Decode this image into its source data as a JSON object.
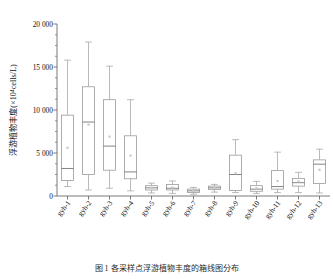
{
  "figure": {
    "caption": "图 1 各采样点浮游植物丰度的箱线图分布"
  },
  "chart_data": {
    "type": "box",
    "title": "",
    "xlabel": "",
    "ylabel": "浮游植物丰度(×10⁴cells/L)",
    "ylim": [
      0,
      20000
    ],
    "ytick_labels": [
      "0",
      "5 000",
      "10 000",
      "15 000",
      "20 000"
    ],
    "ytick_values": [
      0,
      5000,
      10000,
      15000,
      20000
    ],
    "yminor_step": 1250,
    "grid": false,
    "legend": null,
    "categories": [
      "gyh-1",
      "gyh-2",
      "gyh-3",
      "gyh-4",
      "gyh-5",
      "gyh-6",
      "gyh-7",
      "gyh-8",
      "gyh-9",
      "gyh-10",
      "gyh-11",
      "gyh-12",
      "gyh-13"
    ],
    "boxes": [
      {
        "label": "gyh-1",
        "min": 1100,
        "q1": 1800,
        "median": 3200,
        "q3": 9400,
        "max": 15800,
        "mean": 5600
      },
      {
        "label": "gyh-2",
        "min": 700,
        "q1": 2500,
        "median": 8600,
        "q3": 12700,
        "max": 17900,
        "mean": 8300
      },
      {
        "label": "gyh-3",
        "min": 900,
        "q1": 3000,
        "median": 5800,
        "q3": 11200,
        "max": 15100,
        "mean": 6900
      },
      {
        "label": "gyh-4",
        "min": 600,
        "q1": 2000,
        "median": 2800,
        "q3": 7000,
        "max": 11200,
        "mean": 4700
      },
      {
        "label": "gyh-5",
        "min": 350,
        "q1": 700,
        "median": 950,
        "q3": 1200,
        "max": 1500,
        "mean": 950
      },
      {
        "label": "gyh-6",
        "min": 300,
        "q1": 700,
        "median": 900,
        "q3": 1350,
        "max": 1750,
        "mean": 1000
      },
      {
        "label": "gyh-7",
        "min": 200,
        "q1": 400,
        "median": 600,
        "q3": 800,
        "max": 1000,
        "mean": 600
      },
      {
        "label": "gyh-8",
        "min": 450,
        "q1": 750,
        "median": 950,
        "q3": 1150,
        "max": 1350,
        "mean": 950
      },
      {
        "label": "gyh-9",
        "min": 400,
        "q1": 650,
        "median": 2500,
        "q3": 4750,
        "max": 6550,
        "mean": 2650
      },
      {
        "label": "gyh-10",
        "min": 300,
        "q1": 550,
        "median": 800,
        "q3": 1200,
        "max": 1700,
        "mean": 900
      },
      {
        "label": "gyh-11",
        "min": 400,
        "q1": 800,
        "median": 1100,
        "q3": 2950,
        "max": 5100,
        "mean": 1750
      },
      {
        "label": "gyh-12",
        "min": 400,
        "q1": 1150,
        "median": 1550,
        "q3": 2050,
        "max": 2750,
        "mean": 1700
      },
      {
        "label": "gyh-13",
        "min": 350,
        "q1": 1450,
        "median": 3700,
        "q3": 4200,
        "max": 5450,
        "mean": 3050
      }
    ]
  },
  "colors": {
    "axis": "#6b6b6b",
    "box_stroke": "#9a9a9a",
    "median": "#6e6e6e",
    "whisker": "#a3a3a3",
    "mean": "#c8c8c8",
    "text": "#141414",
    "background": "#ffffff"
  }
}
